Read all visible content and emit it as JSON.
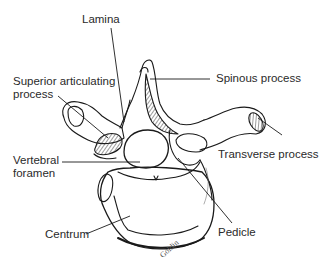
{
  "figure": {
    "labels": {
      "lamina": "Lamina",
      "superior_articulating_1": "Superior articulating",
      "superior_articulating_2": "process",
      "spinous_process": "Spinous process",
      "transverse_process": "Transverse process",
      "vertebral_foramen_1": "Vertebral",
      "vertebral_foramen_2": "foramen",
      "centrum": "Centrum",
      "pedicle": "Pedicle"
    },
    "signature": "Goldin"
  },
  "colors": {
    "ink": "#1a1a1a",
    "background": "#ffffff"
  }
}
